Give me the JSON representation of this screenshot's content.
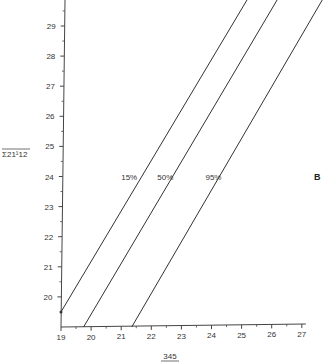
{
  "panel_label": "B",
  "chart_data": {
    "type": "line",
    "title": "",
    "xlabel": "345",
    "ylabel": "Σ21¹12",
    "xlim": [
      19,
      27
    ],
    "ylim": [
      19,
      30
    ],
    "x_ticks": [
      "19",
      "20",
      "21",
      "22",
      "23",
      "24",
      "25",
      "26",
      "27"
    ],
    "y_ticks": [
      "20",
      "21",
      "22",
      "23",
      "24",
      "25",
      "26",
      "27",
      "28",
      "29"
    ],
    "grid": false,
    "legend": "inline labels",
    "series": [
      {
        "name": "15%",
        "points": [
          [
            19.0,
            19.5
          ],
          [
            25.2,
            29.9
          ]
        ]
      },
      {
        "name": "50%",
        "points": [
          [
            19.75,
            19.0
          ],
          [
            26.2,
            29.9
          ]
        ]
      },
      {
        "name": "95%",
        "points": [
          [
            21.35,
            19.0
          ],
          [
            27.7,
            29.9
          ]
        ]
      }
    ],
    "series_label_positions": [
      {
        "name": "15%",
        "x": 21.0,
        "y": 24.0
      },
      {
        "name": "50%",
        "x": 22.2,
        "y": 24.0
      },
      {
        "name": "95%",
        "x": 23.8,
        "y": 24.0
      }
    ]
  }
}
